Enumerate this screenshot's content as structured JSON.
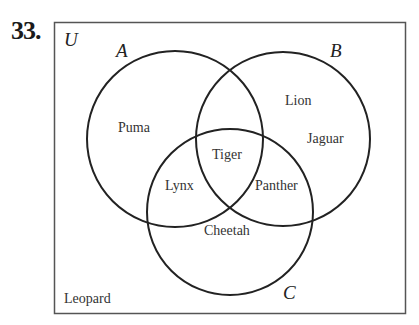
{
  "problem": {
    "number": "33.",
    "top_fragment": "{ , , , , , , }"
  },
  "diagram": {
    "universe_label": "U",
    "sets": [
      {
        "label": "A",
        "cx": 175,
        "cy": 139,
        "r": 88
      },
      {
        "label": "B",
        "cx": 283,
        "cy": 139,
        "r": 87
      },
      {
        "label": "C",
        "cx": 230,
        "cy": 212,
        "r": 83
      }
    ],
    "regions": {
      "A_only": "Puma",
      "B_only_1": "Lion",
      "B_only_2": "Jaguar",
      "A_B_C": "Tiger",
      "A_C_only": "Lynx",
      "B_C_only": "Panther",
      "C_only": "Cheetah",
      "outside": "Leopard"
    },
    "colors": {
      "stroke": "#222222",
      "box_stroke": "#555555",
      "text": "#333333"
    }
  }
}
